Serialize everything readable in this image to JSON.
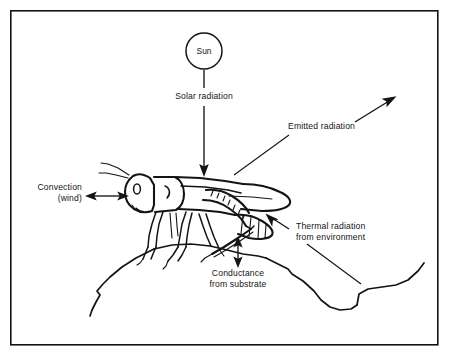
{
  "figure": {
    "background_color": "#ffffff",
    "ink_color": "#141414",
    "frame": {
      "name": "figure-border",
      "x": 10,
      "y": 10,
      "width": 428,
      "height": 335
    }
  },
  "sun": {
    "label": "Sun",
    "center_x": 204,
    "center_y": 51,
    "radius": 18
  },
  "labels": {
    "solar_radiation": "Solar radiation",
    "emitted_radiation": "Emitted radiation",
    "convection_line1": "Convection",
    "convection_line2": "(wind)",
    "thermal_line1": "Thermal radiation",
    "thermal_line2": "from environment",
    "conductance_line1": "Conductance",
    "conductance_line2": "from substrate"
  },
  "flows": [
    {
      "id": "solar-radiation",
      "label": "Solar radiation",
      "direction": "downward",
      "arrowheads": 1,
      "from": "sun",
      "to": "grasshopper"
    },
    {
      "id": "emitted-radiation",
      "label": "Emitted radiation",
      "direction": "up-right",
      "arrowheads": 1,
      "from": "grasshopper",
      "to": "sky"
    },
    {
      "id": "convection-wind",
      "label": "Convection (wind)",
      "direction": "bidirectional-horizontal",
      "arrowheads": 2,
      "from": "air",
      "to": "grasshopper"
    },
    {
      "id": "thermal-radiation",
      "label": "Thermal radiation from environment",
      "direction": "up-left",
      "arrowheads": 1,
      "from": "environment",
      "to": "grasshopper"
    },
    {
      "id": "conductance-substrate",
      "label": "Conductance from substrate",
      "direction": "bidirectional-vertical",
      "arrowheads": 2,
      "from": "substrate",
      "to": "grasshopper"
    }
  ],
  "subject": {
    "name": "grasshopper",
    "perched_on": "rock"
  }
}
